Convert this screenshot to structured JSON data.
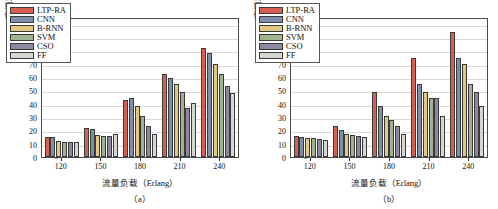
{
  "figure": {
    "panels": [
      {
        "caption": "（a）",
        "ylabel": "资源利用率（%）",
        "xlabel": "流量负载（Erlang）"
      },
      {
        "caption": "（b）",
        "ylabel": "资源利用率（%）",
        "xlabel": "流量负载（Erlang）"
      }
    ],
    "legend": [
      {
        "label": "LTP-RA",
        "color": "#d9604f"
      },
      {
        "label": "CNN",
        "color": "#7f8fab"
      },
      {
        "label": "B-RNN",
        "color": "#e2c97f"
      },
      {
        "label": "SVM",
        "color": "#9fb391"
      },
      {
        "label": "CSO",
        "color": "#8d87a0"
      },
      {
        "label": "FF",
        "color": "#d6d6d2"
      }
    ],
    "yticks": [
      "0",
      "10",
      "20",
      "30",
      "40",
      "50",
      "60",
      "70",
      "80",
      "90",
      "100"
    ]
  },
  "chart_data": [
    {
      "type": "bar",
      "title": "（a）",
      "xlabel": "流量负载（Erlang）",
      "ylabel": "资源利用率（%）",
      "ylim": [
        0,
        105
      ],
      "yticks": [
        0,
        10,
        20,
        30,
        40,
        50,
        60,
        70,
        80,
        90,
        100
      ],
      "grid": true,
      "legend_position": "upper-left",
      "categories": [
        "120",
        "150",
        "180",
        "210",
        "240"
      ],
      "series": [
        {
          "name": "LTP-RA",
          "color": "#d9604f",
          "values": [
            15.0,
            22.0,
            43.0,
            62.5,
            82.0
          ]
        },
        {
          "name": "CNN",
          "color": "#7f8fab",
          "values": [
            15.0,
            21.0,
            44.5,
            59.0,
            78.0
          ]
        },
        {
          "name": "B-RNN",
          "color": "#e2c97f",
          "values": [
            12.0,
            16.5,
            38.5,
            54.5,
            70.0
          ]
        },
        {
          "name": "SVM",
          "color": "#9fb391",
          "values": [
            11.5,
            15.5,
            31.0,
            48.5,
            62.5
          ]
        },
        {
          "name": "CSO",
          "color": "#8d87a0",
          "values": [
            11.5,
            15.5,
            23.5,
            36.5,
            53.0
          ]
        },
        {
          "name": "FF",
          "color": "#d6d6d2",
          "values": [
            11.0,
            17.5,
            17.0,
            40.5,
            48.0
          ]
        }
      ]
    },
    {
      "type": "bar",
      "title": "（b）",
      "xlabel": "流量负载（Erlang）",
      "ylabel": "资源利用率（%）",
      "ylim": [
        0,
        105
      ],
      "yticks": [
        0,
        10,
        20,
        30,
        40,
        50,
        60,
        70,
        80,
        90,
        100
      ],
      "grid": true,
      "legend_position": "upper-left",
      "categories": [
        "120",
        "150",
        "180",
        "210",
        "240"
      ],
      "series": [
        {
          "name": "LTP-RA",
          "color": "#d9604f",
          "values": [
            16.0,
            23.5,
            49.0,
            74.5,
            93.5
          ]
        },
        {
          "name": "CNN",
          "color": "#7f8fab",
          "values": [
            15.0,
            20.0,
            38.0,
            54.5,
            74.5
          ]
        },
        {
          "name": "B-RNN",
          "color": "#e2c97f",
          "values": [
            14.0,
            17.0,
            31.0,
            49.0,
            70.0
          ]
        },
        {
          "name": "SVM",
          "color": "#9fb391",
          "values": [
            14.0,
            16.5,
            27.5,
            44.5,
            54.5
          ]
        },
        {
          "name": "CSO",
          "color": "#8d87a0",
          "values": [
            13.5,
            16.0,
            23.5,
            44.5,
            48.5
          ]
        },
        {
          "name": "FF",
          "color": "#d6d6d2",
          "values": [
            12.5,
            15.0,
            17.5,
            31.0,
            38.0
          ]
        }
      ]
    }
  ]
}
